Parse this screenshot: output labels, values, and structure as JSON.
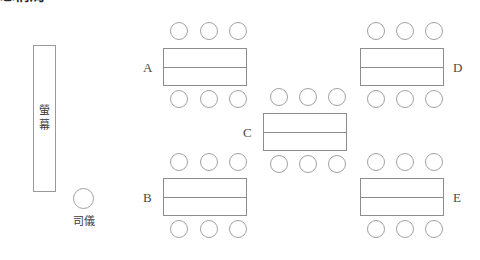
{
  "heading": "忘情局",
  "stage": {
    "name": "screen-box",
    "label": "螢\n幕"
  },
  "host": {
    "name": "mc-marker",
    "label": "司儀"
  },
  "tables": [
    {
      "id": "A",
      "label": "A",
      "label_side": "left",
      "rect": {
        "x": 163,
        "y": 48,
        "w": 84,
        "h": 38
      },
      "seats_top": [
        170,
        200,
        229
      ],
      "seats_bottom": [
        170,
        200,
        229
      ],
      "seat_top_y": 22,
      "seat_bottom_y": 90,
      "label_x": 143,
      "label_y": 61
    },
    {
      "id": "D",
      "label": "D",
      "label_side": "right",
      "rect": {
        "x": 360,
        "y": 48,
        "w": 84,
        "h": 38
      },
      "seats_top": [
        367,
        396,
        425
      ],
      "seats_bottom": [
        367,
        396,
        425
      ],
      "seat_top_y": 22,
      "seat_bottom_y": 90,
      "label_x": 453,
      "label_y": 61
    },
    {
      "id": "C",
      "label": "C",
      "label_side": "left",
      "rect": {
        "x": 263,
        "y": 113,
        "w": 84,
        "h": 38
      },
      "seats_top": [
        270,
        299,
        328
      ],
      "seats_bottom": [
        270,
        299,
        328
      ],
      "seat_top_y": 88,
      "seat_bottom_y": 155,
      "label_x": 243,
      "label_y": 126
    },
    {
      "id": "B",
      "label": "B",
      "label_side": "left",
      "rect": {
        "x": 163,
        "y": 178,
        "w": 84,
        "h": 38
      },
      "seats_top": [
        170,
        200,
        229
      ],
      "seats_bottom": [
        170,
        200,
        229
      ],
      "seat_top_y": 153,
      "seat_bottom_y": 220,
      "label_x": 143,
      "label_y": 191
    },
    {
      "id": "E",
      "label": "E",
      "label_side": "right",
      "rect": {
        "x": 360,
        "y": 178,
        "w": 84,
        "h": 38
      },
      "seats_top": [
        367,
        396,
        425
      ],
      "seats_bottom": [
        367,
        396,
        425
      ],
      "seat_top_y": 153,
      "seat_bottom_y": 220,
      "label_x": 453,
      "label_y": 191
    }
  ],
  "colors": {
    "background": "#ffffff",
    "line": "#8c8c8c",
    "seat_line": "#a2a2a2",
    "text": "#4a4a4a"
  }
}
